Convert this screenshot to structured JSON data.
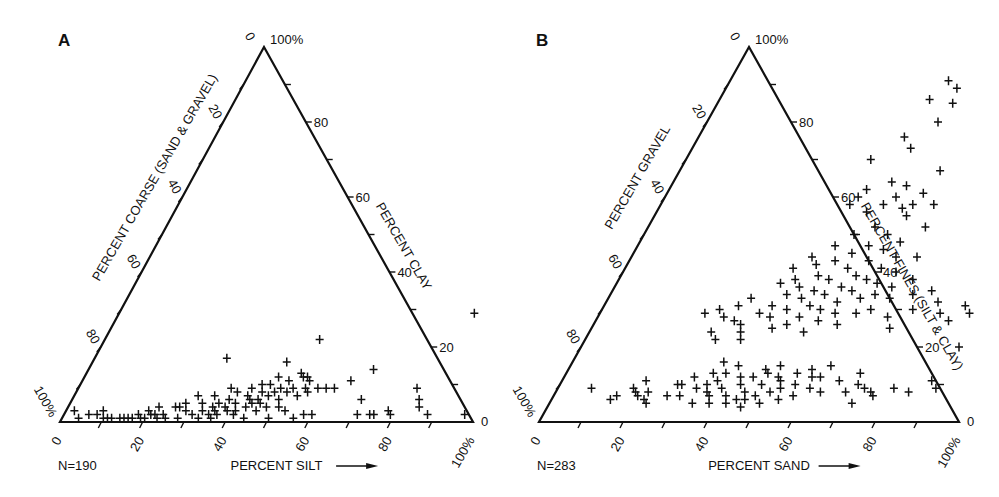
{
  "chart_data": [
    {
      "type": "scatter",
      "subtype": "ternary",
      "panel": "A",
      "title": "",
      "n_label": "N=190",
      "axes": {
        "bottom": {
          "label": "PERCENT SILT",
          "ticks": [
            "0",
            "20",
            "40",
            "60",
            "80",
            "100%"
          ],
          "direction": "left-to-right"
        },
        "right": {
          "label": "PERCENT CLAY",
          "ticks": [
            "0",
            "20",
            "40",
            "60",
            "80",
            "100%"
          ],
          "direction": "bottom-to-top"
        },
        "left": {
          "label": "PERCENT COARSE (SAND & GRAVEL)",
          "ticks": [
            "0",
            "20",
            "40",
            "60",
            "80",
            "100%"
          ],
          "direction": "top-to-bottom"
        }
      },
      "geometry": {
        "left": [
          60,
          422
        ],
        "right": [
          473,
          422
        ],
        "apex": [
          264,
          47
        ]
      },
      "points_note": "[silt%, clay%]; coarse = 100 - silt - clay",
      "points": [
        [
          2,
          3
        ],
        [
          4,
          1
        ],
        [
          6,
          2
        ],
        [
          8,
          2
        ],
        [
          9,
          3
        ],
        [
          10,
          1
        ],
        [
          11,
          1
        ],
        [
          12,
          1
        ],
        [
          14,
          1
        ],
        [
          15,
          1
        ],
        [
          16,
          1
        ],
        [
          17,
          1
        ],
        [
          18,
          2
        ],
        [
          19,
          1
        ],
        [
          20,
          1
        ],
        [
          20,
          3
        ],
        [
          21,
          2
        ],
        [
          22,
          2
        ],
        [
          22,
          4
        ],
        [
          23,
          1
        ],
        [
          24,
          2
        ],
        [
          25,
          1
        ],
        [
          26,
          4
        ],
        [
          27,
          4
        ],
        [
          28,
          1
        ],
        [
          28,
          5
        ],
        [
          29,
          3
        ],
        [
          30,
          7
        ],
        [
          31,
          2
        ],
        [
          32,
          5
        ],
        [
          33,
          1
        ],
        [
          33,
          3
        ],
        [
          34,
          7
        ],
        [
          35,
          2
        ],
        [
          35,
          4
        ],
        [
          36,
          1
        ],
        [
          36,
          3
        ],
        [
          36,
          5
        ],
        [
          37,
          2
        ],
        [
          37,
          9
        ],
        [
          38,
          4
        ],
        [
          38,
          6
        ],
        [
          39,
          3
        ],
        [
          39,
          8
        ],
        [
          40,
          5
        ],
        [
          41,
          2
        ],
        [
          41,
          3
        ],
        [
          42,
          7
        ],
        [
          42,
          9
        ],
        [
          43,
          6
        ],
        [
          43,
          4
        ],
        [
          44,
          1
        ],
        [
          44,
          5
        ],
        [
          44,
          10
        ],
        [
          45,
          6
        ],
        [
          45,
          8
        ],
        [
          46,
          3
        ],
        [
          46,
          5
        ],
        [
          46,
          10
        ],
        [
          47,
          7
        ],
        [
          47,
          12
        ],
        [
          48,
          4
        ],
        [
          48,
          8
        ],
        [
          49,
          9
        ],
        [
          50,
          1
        ],
        [
          50,
          6
        ],
        [
          50,
          11
        ],
        [
          51,
          4
        ],
        [
          51,
          8
        ],
        [
          52,
          9
        ],
        [
          52,
          13
        ],
        [
          53,
          3
        ],
        [
          53,
          12
        ],
        [
          54,
          7
        ],
        [
          54,
          12
        ],
        [
          55,
          9
        ],
        [
          55,
          11
        ],
        [
          56,
          1
        ],
        [
          56,
          8
        ],
        [
          58,
          2
        ],
        [
          58,
          9
        ],
        [
          60,
          2
        ],
        [
          60,
          9
        ],
        [
          62,
          9
        ],
        [
          65,
          11
        ],
        [
          70,
          6
        ],
        [
          71,
          2
        ],
        [
          74,
          2
        ],
        [
          75,
          2
        ],
        [
          78,
          3
        ],
        [
          79,
          2
        ],
        [
          82,
          9
        ],
        [
          84,
          6
        ],
        [
          85,
          4
        ],
        [
          88,
          2
        ],
        [
          97,
          2
        ],
        [
          32,
          17
        ],
        [
          47,
          16
        ],
        [
          52,
          22
        ],
        [
          69,
          14
        ],
        [
          86,
          29
        ]
      ]
    },
    {
      "type": "scatter",
      "subtype": "ternary",
      "panel": "B",
      "title": "",
      "n_label": "N=283",
      "axes": {
        "bottom": {
          "label": "PERCENT SAND",
          "ticks": [
            "0",
            "20",
            "40",
            "60",
            "80",
            "100%"
          ],
          "direction": "left-to-right"
        },
        "right": {
          "label": "PERCENT FINES (SILT & CLAY)",
          "ticks": [
            "0",
            "20",
            "40",
            "60",
            "80",
            "100%"
          ],
          "direction": "bottom-to-top"
        },
        "left": {
          "label": "PERCENT GRAVEL",
          "ticks": [
            "0",
            "20",
            "40",
            "60",
            "80",
            "100%"
          ],
          "direction": "top-to-bottom"
        }
      },
      "geometry": {
        "left": [
          539,
          422
        ],
        "right": [
          959,
          422
        ],
        "apex": [
          749,
          47
        ]
      },
      "points_note": "[sand%, fines%]; gravel = 100 - sand - fines",
      "points": [
        [
          8,
          9
        ],
        [
          14,
          6
        ],
        [
          15,
          7
        ],
        [
          18,
          9
        ],
        [
          19,
          8
        ],
        [
          20,
          7
        ],
        [
          20,
          11
        ],
        [
          22,
          6
        ],
        [
          22,
          8
        ],
        [
          23,
          5
        ],
        [
          27,
          7
        ],
        [
          28,
          10
        ],
        [
          29,
          10
        ],
        [
          30,
          7
        ],
        [
          31,
          12
        ],
        [
          33,
          9
        ],
        [
          34,
          5
        ],
        [
          35,
          10
        ],
        [
          35,
          13
        ],
        [
          36,
          8
        ],
        [
          36,
          16
        ],
        [
          37,
          7
        ],
        [
          37,
          11
        ],
        [
          38,
          5
        ],
        [
          38,
          13
        ],
        [
          39,
          9
        ],
        [
          40,
          15
        ],
        [
          41,
          7
        ],
        [
          42,
          5
        ],
        [
          42,
          12
        ],
        [
          43,
          10
        ],
        [
          44,
          6
        ],
        [
          45,
          12
        ],
        [
          45,
          8
        ],
        [
          46,
          4
        ],
        [
          46,
          6
        ],
        [
          47,
          14
        ],
        [
          48,
          7
        ],
        [
          48,
          10
        ],
        [
          48,
          13
        ],
        [
          50,
          5
        ],
        [
          50,
          15
        ],
        [
          51,
          8
        ],
        [
          51,
          12
        ],
        [
          52,
          11
        ],
        [
          53,
          9
        ],
        [
          54,
          6
        ],
        [
          55,
          13
        ],
        [
          56,
          10
        ],
        [
          57,
          7
        ],
        [
          58,
          14
        ],
        [
          59,
          12
        ],
        [
          60,
          9
        ],
        [
          61,
          12
        ],
        [
          62,
          15
        ],
        [
          63,
          8
        ],
        [
          66,
          11
        ],
        [
          69,
          8
        ],
        [
          70,
          13
        ],
        [
          71,
          10
        ],
        [
          72,
          5
        ],
        [
          73,
          9
        ],
        [
          75,
          8
        ],
        [
          76,
          7
        ],
        [
          80,
          9
        ],
        [
          84,
          8
        ],
        [
          88,
          11
        ],
        [
          90,
          9
        ],
        [
          25,
          29
        ],
        [
          28,
          30
        ],
        [
          29,
          24
        ],
        [
          30,
          28
        ],
        [
          31,
          22
        ],
        [
          32,
          31
        ],
        [
          33,
          27
        ],
        [
          34,
          33
        ],
        [
          35,
          26
        ],
        [
          36,
          24
        ],
        [
          37,
          22
        ],
        [
          38,
          29
        ],
        [
          39,
          37
        ],
        [
          40,
          31
        ],
        [
          40,
          41
        ],
        [
          41,
          28
        ],
        [
          42,
          34
        ],
        [
          42,
          38
        ],
        [
          43,
          25
        ],
        [
          43,
          44
        ],
        [
          44,
          30
        ],
        [
          44,
          36
        ],
        [
          45,
          42
        ],
        [
          46,
          33
        ],
        [
          46,
          26
        ],
        [
          47,
          39
        ],
        [
          47,
          47
        ],
        [
          48,
          28
        ],
        [
          48,
          35
        ],
        [
          49,
          43
        ],
        [
          49,
          31
        ],
        [
          50,
          38
        ],
        [
          50,
          50
        ],
        [
          51,
          24
        ],
        [
          51,
          34
        ],
        [
          52,
          45
        ],
        [
          52,
          30
        ],
        [
          53,
          41
        ],
        [
          53,
          27
        ],
        [
          54,
          36
        ],
        [
          54,
          52
        ],
        [
          55,
          32
        ],
        [
          55,
          47
        ],
        [
          56,
          39
        ],
        [
          56,
          29
        ],
        [
          57,
          43
        ],
        [
          57,
          35
        ],
        [
          58,
          50
        ],
        [
          58,
          26
        ],
        [
          59,
          38
        ],
        [
          59,
          46
        ],
        [
          60,
          33
        ],
        [
          60,
          55
        ],
        [
          61,
          41
        ],
        [
          61,
          29
        ],
        [
          62,
          37
        ],
        [
          62,
          48
        ],
        [
          63,
          34
        ],
        [
          63,
          44
        ],
        [
          64,
          30
        ],
        [
          65,
          40
        ],
        [
          66,
          36
        ],
        [
          66,
          52
        ],
        [
          67,
          33
        ],
        [
          68,
          44
        ],
        [
          69,
          28
        ],
        [
          70,
          38
        ],
        [
          71,
          25
        ],
        [
          72,
          34
        ],
        [
          74,
          30
        ],
        [
          76,
          35
        ],
        [
          79,
          32
        ],
        [
          81,
          29
        ],
        [
          84,
          27
        ],
        [
          86,
          31
        ],
        [
          88,
          29
        ],
        [
          90,
          20
        ],
        [
          45,
          58
        ],
        [
          46,
          60
        ],
        [
          47,
          62
        ],
        [
          50,
          56
        ],
        [
          52,
          64
        ],
        [
          53,
          58
        ],
        [
          55,
          60
        ],
        [
          56,
          63
        ],
        [
          58,
          57
        ],
        [
          60,
          58
        ],
        [
          61,
          61
        ],
        [
          44,
          70
        ],
        [
          49,
          76
        ],
        [
          52,
          73
        ],
        [
          55,
          80
        ],
        [
          50,
          86
        ],
        [
          52,
          91
        ],
        [
          55,
          89
        ],
        [
          56,
          85
        ],
        [
          62,
          67
        ],
        [
          65,
          58
        ]
      ]
    }
  ],
  "figure": {
    "panel_a_label": "A",
    "panel_b_label": "B",
    "apex_top_zero": "0",
    "apex_100": "100%",
    "ink_color": "#111111",
    "background": "#ffffff"
  }
}
